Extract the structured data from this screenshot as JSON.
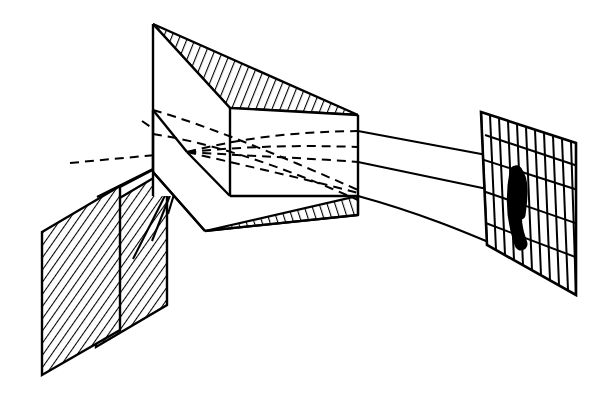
{
  "figure": {
    "background_color": "#ffffff",
    "ink_color": "#000000",
    "width": 600,
    "height": 402
  },
  "parts": {
    "slit_plate_front": {
      "label": "front slit plate",
      "hatch_style": "diagonal-lines",
      "points": "42,232 120,186 120,330 42,375"
    },
    "slit_plate_back": {
      "label": "rear slit plate",
      "hatch_style": "diagonal-lines",
      "points": "96,212 167,170 167,305 96,347"
    },
    "prism": {
      "label": "triangular dispersing prism",
      "apex": "153,24",
      "front_vertical_edge": "153,24 153,196",
      "right_vertical_edge": "358,115 358,215",
      "top_face_points": "153,24 358,115 230,108",
      "bottom_face_points": "160,180 205,231 358,215",
      "top_face_hatched": true,
      "bottom_face_hatched": true
    },
    "screen": {
      "label": "projection screen with grid",
      "corners": "481,112 576,143 576,295 487,245",
      "vertical_line_count": 11,
      "horizontal_line_count": 4
    },
    "spectral_band": {
      "label": "dispersed spectral line",
      "color": "#000000",
      "shape": "curved vertical band"
    }
  },
  "rays": {
    "incident_dashed": [
      {
        "name": "incident-ray-upper",
        "path": "70,163 187,152"
      },
      {
        "name": "incident-ray-lower",
        "path": "70,163 187,152"
      }
    ],
    "source_solid": [
      {
        "name": "source-ray-a",
        "path": "110,196 187,152"
      },
      {
        "name": "source-ray-b",
        "path": "132,258 187,152"
      },
      {
        "name": "source-ray-c",
        "path": "168,212 187,152"
      }
    ],
    "internal_dashed_count": 6,
    "exit_solid": [
      {
        "name": "exit-ray-top",
        "path": "358,138 487,163"
      },
      {
        "name": "exit-ray-middle",
        "path": "358,162 487,196"
      },
      {
        "name": "exit-ray-bottom",
        "path": "358,196 500,246"
      }
    ]
  }
}
